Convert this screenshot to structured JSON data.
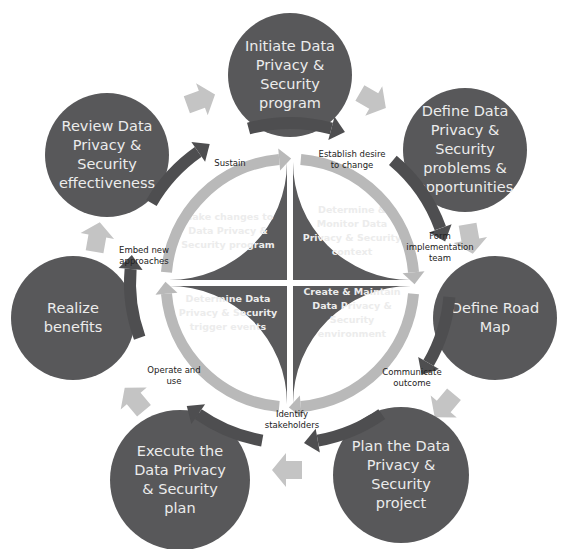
{
  "outer_steps": [
    {
      "id": "initiate",
      "lines": [
        "Initiate Data",
        "Privacy &",
        "Security",
        "program"
      ]
    },
    {
      "id": "define-problems",
      "lines": [
        "Define Data",
        "Privacy &",
        "Security",
        "problems &",
        "opportunities"
      ]
    },
    {
      "id": "define-road-map",
      "lines": [
        "Define Road",
        "Map"
      ]
    },
    {
      "id": "plan",
      "lines": [
        "Plan the Data",
        "Privacy &",
        "Security",
        "project"
      ]
    },
    {
      "id": "execute",
      "lines": [
        "Execute the",
        "Data Privacy",
        "& Security",
        "plan"
      ]
    },
    {
      "id": "realize",
      "lines": [
        "Realize",
        "benefits"
      ]
    },
    {
      "id": "review",
      "lines": [
        "Review Data",
        "Privacy &",
        "Security",
        "effectiveness"
      ]
    }
  ],
  "transition_labels": [
    {
      "id": "establish",
      "lines": [
        "Establish desire",
        "to change"
      ]
    },
    {
      "id": "form",
      "lines": [
        "Form",
        "implementation",
        "team"
      ]
    },
    {
      "id": "communicate",
      "lines": [
        "Communicate",
        "outcome"
      ]
    },
    {
      "id": "identify",
      "lines": [
        "Identify",
        "stakeholders"
      ]
    },
    {
      "id": "operate",
      "lines": [
        "Operate and",
        "use"
      ]
    },
    {
      "id": "embed",
      "lines": [
        "Embed new",
        "approaches"
      ]
    },
    {
      "id": "sustain",
      "lines": [
        "Sustain"
      ]
    }
  ],
  "inner_quadrants": [
    {
      "id": "top-left",
      "lines": [
        "Make changes to",
        "Data Privacy &",
        "Security program"
      ]
    },
    {
      "id": "top-right",
      "lines": [
        "Determine &",
        "Monitor Data",
        "Privacy & Security",
        "context"
      ]
    },
    {
      "id": "bottom-right",
      "lines": [
        "Create & Maintain",
        "Data Privacy &",
        "Security",
        "environment"
      ]
    },
    {
      "id": "bottom-left",
      "lines": [
        "Determine Data",
        "Privacy & Security",
        "trigger events"
      ]
    }
  ],
  "colors": {
    "circle": "#58585a",
    "inner_ring": "#b9b9b9",
    "dark_arrow": "#4e4e50",
    "light_arrow": "#c4c4c4"
  }
}
